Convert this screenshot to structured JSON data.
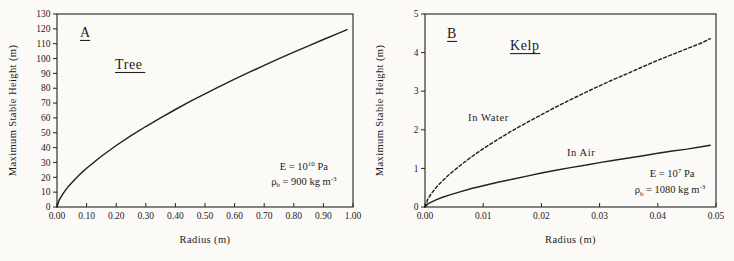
{
  "figure": {
    "background": "#fbfaf7",
    "line_color": "#222222",
    "text_color": "#1b1b1b"
  },
  "chart_data": [
    {
      "id": "tree",
      "type": "line",
      "panel_label": "A",
      "title": "Tree",
      "xlabel": "Radius (m)",
      "ylabel": "Maximum Stable Height (m)",
      "xlim": [
        0,
        1.0
      ],
      "ylim": [
        0,
        130
      ],
      "grid": false,
      "x_tick_values": [
        0,
        0.1,
        0.2,
        0.3,
        0.4,
        0.5,
        0.6,
        0.7,
        0.8,
        0.9,
        1.0
      ],
      "x_tick_labels": [
        "0.00",
        "0.10",
        "0.20",
        "0.30",
        "0.40",
        "0.50",
        "0.60",
        "0.70",
        "0.80",
        "0.90",
        "1.00"
      ],
      "y_tick_values": [
        0,
        10,
        20,
        30,
        40,
        50,
        60,
        70,
        80,
        90,
        100,
        110,
        120,
        130
      ],
      "y_tick_labels": [
        "0",
        "10",
        "20",
        "30",
        "40",
        "50",
        "60",
        "70",
        "80",
        "90",
        "100",
        "110",
        "120",
        "130"
      ],
      "series": [
        {
          "name": "Tree",
          "style": "solid",
          "x": [
            0,
            0.005,
            0.01,
            0.02,
            0.03,
            0.04,
            0.06,
            0.08,
            0.1,
            0.15,
            0.2,
            0.25,
            0.3,
            0.35,
            0.4,
            0.45,
            0.5,
            0.55,
            0.6,
            0.65,
            0.7,
            0.75,
            0.8,
            0.85,
            0.9,
            0.95,
            0.98
          ],
          "y": [
            0,
            3.5,
            5.6,
            8.9,
            11.7,
            14.2,
            18.6,
            22.5,
            26.1,
            34.2,
            41.4,
            48.0,
            54.2,
            60.1,
            65.7,
            71.1,
            76.2,
            81.2,
            86.1,
            90.8,
            95.4,
            99.9,
            104.3,
            108.6,
            112.8,
            116.9,
            119.4
          ]
        }
      ],
      "curve_labels": [],
      "annotations": [
        {
          "fx": 0.834,
          "fy": 0.808,
          "parts": [
            {
              "t": "E = 10"
            },
            {
              "t": "10",
              "sup": true
            },
            {
              "t": " Pa"
            }
          ]
        },
        {
          "fx": 0.834,
          "fy": 0.886,
          "parts": [
            {
              "t": "ρ"
            },
            {
              "t": "b",
              "sub": true
            },
            {
              "t": " = 900 kg m"
            },
            {
              "t": "-3",
              "sup": true
            }
          ]
        }
      ],
      "panel_label_pos": {
        "fx": 0.078,
        "fy": 0.119
      },
      "title_pos": {
        "fx": 0.196,
        "fy": 0.285
      },
      "margins": {
        "left": 57,
        "right": 14,
        "top": 14,
        "bottom": 54
      }
    },
    {
      "id": "kelp",
      "type": "line",
      "panel_label": "B",
      "title": "Kelp",
      "xlabel": "Radius (m)",
      "ylabel": "Maximum Stable Height (m)",
      "xlim": [
        0,
        0.05
      ],
      "ylim": [
        0,
        5
      ],
      "grid": false,
      "x_tick_values": [
        0,
        0.01,
        0.02,
        0.03,
        0.04,
        0.05
      ],
      "x_tick_labels": [
        "0.00",
        "0.01",
        "0.02",
        "0.03",
        "0.04",
        "0.05"
      ],
      "y_tick_values": [
        0,
        1,
        2,
        3,
        4,
        5
      ],
      "y_tick_labels": [
        "0",
        "1",
        "2",
        "3",
        "4",
        "5"
      ],
      "series": [
        {
          "name": "In Water",
          "style": "dashed",
          "x": [
            0,
            0.0005,
            0.001,
            0.002,
            0.003,
            0.004,
            0.006,
            0.008,
            0.01,
            0.0125,
            0.015,
            0.0175,
            0.02,
            0.0225,
            0.025,
            0.0275,
            0.03,
            0.0325,
            0.035,
            0.0375,
            0.04,
            0.0425,
            0.045,
            0.0475,
            0.049
          ],
          "y": [
            0,
            0.21,
            0.33,
            0.52,
            0.68,
            0.82,
            1.07,
            1.3,
            1.51,
            1.75,
            1.98,
            2.19,
            2.39,
            2.59,
            2.78,
            2.96,
            3.14,
            3.31,
            3.47,
            3.64,
            3.8,
            3.95,
            4.1,
            4.25,
            4.36
          ]
        },
        {
          "name": "In Air",
          "style": "solid",
          "x": [
            0,
            0.0005,
            0.001,
            0.002,
            0.003,
            0.004,
            0.006,
            0.008,
            0.01,
            0.0125,
            0.015,
            0.0175,
            0.02,
            0.0225,
            0.025,
            0.0275,
            0.03,
            0.0325,
            0.035,
            0.0375,
            0.04,
            0.0425,
            0.045,
            0.0475,
            0.049
          ],
          "y": [
            0,
            0.08,
            0.12,
            0.19,
            0.25,
            0.3,
            0.39,
            0.48,
            0.55,
            0.64,
            0.72,
            0.8,
            0.88,
            0.95,
            1.02,
            1.08,
            1.15,
            1.21,
            1.27,
            1.33,
            1.39,
            1.45,
            1.5,
            1.56,
            1.6
          ]
        }
      ],
      "curve_labels": [
        {
          "text": "In Water",
          "x": 0.0074,
          "y": 2.22
        },
        {
          "text": "In Air",
          "x": 0.0244,
          "y": 1.31
        }
      ],
      "annotations": [
        {
          "fx": 0.849,
          "fy": 0.845,
          "parts": [
            {
              "t": "E = 10"
            },
            {
              "t": "7",
              "sup": true
            },
            {
              "t": " Pa"
            }
          ]
        },
        {
          "fx": 0.842,
          "fy": 0.93,
          "parts": [
            {
              "t": "ρ"
            },
            {
              "t": "b",
              "sub": true
            },
            {
              "t": " = 1080 kg m"
            },
            {
              "t": "-3",
              "sup": true
            }
          ]
        }
      ],
      "panel_label_pos": {
        "fx": 0.076,
        "fy": 0.124
      },
      "title_pos": {
        "fx": 0.292,
        "fy": 0.187
      },
      "margins": {
        "left": 58,
        "right": 18,
        "top": 14,
        "bottom": 54
      }
    }
  ]
}
